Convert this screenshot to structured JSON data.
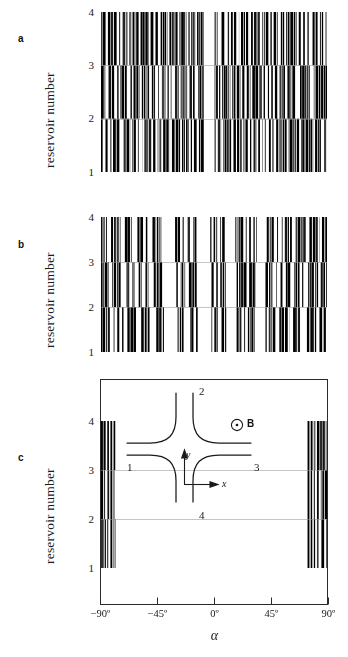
{
  "figure": {
    "background": "#ffffff",
    "ink": "#111111"
  },
  "panels": [
    {
      "letter": "a",
      "ylabel": "reservoir number",
      "yticks": [
        "1",
        "2",
        "3",
        "4"
      ]
    },
    {
      "letter": "b",
      "ylabel": "reservoir number",
      "yticks": [
        "1",
        "2",
        "3",
        "4"
      ]
    },
    {
      "letter": "c",
      "ylabel": "reservoir number",
      "yticks": [
        "1",
        "2",
        "3",
        "4"
      ],
      "xticks": [
        "−90º",
        "−45º",
        "0º",
        "45º",
        "90º"
      ],
      "xlabel": "α"
    }
  ],
  "inset": {
    "terminals": [
      "1",
      "2",
      "3",
      "4"
    ],
    "axis_x": "x",
    "axis_y": "y",
    "field_label": "B",
    "field_icon": "circle-dot-out-of-page-icon"
  },
  "chart_data": {
    "type": "heatmap",
    "title": "",
    "xlabel": "α",
    "ylabel": "reservoir number",
    "xlim": [
      -90,
      90
    ],
    "ylim": [
      1,
      4
    ],
    "xticks": [
      -90,
      -45,
      0,
      45,
      90
    ],
    "yticks": [
      1,
      2,
      3,
      4
    ],
    "xtick_labels": [
      "−90º",
      "−45º",
      "0º",
      "45º",
      "90º"
    ],
    "ytick_labels": [
      "1",
      "2",
      "3",
      "4"
    ],
    "grid": false,
    "legend": false,
    "panels": [
      {
        "label": "a",
        "coverage_note": "near-complete black coverage across the full alpha range with a narrow white gap just left of 0 degrees",
        "white_gaps": [
          [
            -8.0,
            0.5
          ]
        ],
        "series": [
          {
            "name": "reservoir-1",
            "band": [
              1,
              2
            ],
            "filled_intervals": [
              [
                -90,
                -84
              ],
              [
                -82.5,
                -74
              ],
              [
                -72,
                -66.5
              ],
              [
                -65,
                -57
              ],
              [
                -55.5,
                -50
              ],
              [
                -48.5,
                -42
              ],
              [
                -40.5,
                -35
              ],
              [
                -33.5,
                -27
              ],
              [
                -25.5,
                -20
              ],
              [
                -18.5,
                -13.5
              ],
              [
                -12,
                -8
              ],
              [
                0.5,
                6
              ],
              [
                7.5,
                14
              ],
              [
                15.5,
                22
              ],
              [
                23.5,
                30
              ],
              [
                31.5,
                39
              ],
              [
                40.5,
                48
              ],
              [
                49.5,
                58
              ],
              [
                59.5,
                68
              ],
              [
                69.5,
                79
              ],
              [
                80.5,
                90
              ]
            ]
          },
          {
            "name": "reservoir-2",
            "band": [
              2,
              3
            ],
            "filled_intervals": [
              [
                -90,
                -85.5
              ],
              [
                -84,
                -76
              ],
              [
                -74.5,
                -68
              ],
              [
                -66.5,
                -59
              ],
              [
                -57.5,
                -51
              ],
              [
                -49.5,
                -43
              ],
              [
                -41.5,
                -36
              ],
              [
                -34.5,
                -28
              ],
              [
                -26.5,
                -21
              ],
              [
                -19.5,
                -14
              ],
              [
                -12.5,
                -8
              ],
              [
                0.5,
                5
              ],
              [
                6.5,
                13
              ],
              [
                14.5,
                21
              ],
              [
                22.5,
                29
              ],
              [
                30.5,
                38
              ],
              [
                39.5,
                47
              ],
              [
                48.5,
                57
              ],
              [
                58.5,
                67
              ],
              [
                68.5,
                78
              ],
              [
                79.5,
                90
              ]
            ]
          },
          {
            "name": "reservoir-3",
            "band": [
              3,
              4
            ],
            "filled_intervals": [
              [
                -90,
                -86
              ],
              [
                -84.5,
                -77
              ],
              [
                -75.5,
                -69
              ],
              [
                -67.5,
                -60
              ],
              [
                -58.5,
                -52
              ],
              [
                -50.5,
                -44
              ],
              [
                -42.5,
                -37
              ],
              [
                -35.5,
                -29
              ],
              [
                -27.5,
                -22
              ],
              [
                -20.5,
                -15
              ],
              [
                -13.5,
                -8
              ],
              [
                0.5,
                4.5
              ],
              [
                6,
                12
              ],
              [
                13.5,
                20
              ],
              [
                21.5,
                28
              ],
              [
                29.5,
                37
              ],
              [
                38.5,
                46
              ],
              [
                47.5,
                56
              ],
              [
                57.5,
                66
              ],
              [
                67.5,
                77
              ],
              [
                78.5,
                90
              ]
            ]
          }
        ]
      },
      {
        "label": "b",
        "coverage_note": "sparser, blockier stripes with several wide white bands; reservoir 1-2 band is noticeably emptier than in panel a",
        "white_gaps": [
          [
            -38,
            -31
          ],
          [
            -12,
            -3
          ],
          [
            10,
            17
          ],
          [
            34,
            40
          ]
        ],
        "series": [
          {
            "name": "reservoir-1",
            "band": [
              1,
              2
            ],
            "filled_intervals": [
              [
                -90,
                -83
              ],
              [
                -80,
                -72
              ],
              [
                -69,
                -62
              ],
              [
                -58,
                -50
              ],
              [
                -46,
                -39
              ],
              [
                -29,
                -22
              ],
              [
                -19,
                -13
              ],
              [
                -2,
                4
              ],
              [
                6,
                10
              ],
              [
                18,
                25
              ],
              [
                27,
                33
              ],
              [
                41,
                49
              ],
              [
                52,
                60
              ],
              [
                63,
                71
              ],
              [
                74,
                82
              ],
              [
                84,
                90
              ]
            ]
          },
          {
            "name": "reservoir-2",
            "band": [
              2,
              3
            ],
            "filled_intervals": [
              [
                -90,
                -84
              ],
              [
                -81,
                -73
              ],
              [
                -70,
                -63
              ],
              [
                -60,
                -52
              ],
              [
                -48,
                -41
              ],
              [
                -30,
                -23
              ],
              [
                -20,
                -13
              ],
              [
                -2,
                3
              ],
              [
                5,
                10
              ],
              [
                18,
                26
              ],
              [
                28,
                33
              ],
              [
                41,
                50
              ],
              [
                53,
                61
              ],
              [
                64,
                72
              ],
              [
                75,
                83
              ],
              [
                85,
                90
              ]
            ]
          },
          {
            "name": "reservoir-3",
            "band": [
              3,
              4
            ],
            "filled_intervals": [
              [
                -90,
                -85
              ],
              [
                -82,
                -74
              ],
              [
                -71,
                -64
              ],
              [
                -61,
                -53
              ],
              [
                -49,
                -42
              ],
              [
                -31,
                -24
              ],
              [
                -21,
                -14
              ],
              [
                -3,
                3
              ],
              [
                5,
                9
              ],
              [
                17,
                26
              ],
              [
                28,
                34
              ],
              [
                42,
                51
              ],
              [
                54,
                62
              ],
              [
                65,
                73
              ],
              [
                76,
                84
              ],
              [
                86,
                90
              ]
            ]
          }
        ]
      },
      {
        "label": "c",
        "coverage_note": "stripes confined to narrow clusters at the two extreme angles only; the entire central range is white. Black extends only over reservoir numbers 1 to 4 band region above the y=1 line.",
        "white_gaps": [
          [
            -78,
            74
          ]
        ],
        "series": [
          {
            "name": "reservoir-1",
            "band": [
              1,
              2
            ],
            "filled_intervals": [
              [
                -90,
                -86
              ],
              [
                -85,
                -83.5
              ],
              [
                -82.5,
                -81
              ],
              [
                -80,
                -78.5
              ],
              [
                74.5,
                76
              ],
              [
                77,
                78.5
              ],
              [
                79.5,
                81
              ],
              [
                82,
                90
              ]
            ]
          },
          {
            "name": "reservoir-2",
            "band": [
              2,
              3
            ],
            "filled_intervals": [
              [
                -90,
                -86
              ],
              [
                -85,
                -83.5
              ],
              [
                -82.5,
                -81
              ],
              [
                -80,
                -78.5
              ],
              [
                74.5,
                76
              ],
              [
                77,
                78.5
              ],
              [
                79.5,
                81
              ],
              [
                82,
                90
              ]
            ]
          },
          {
            "name": "reservoir-3",
            "band": [
              3,
              4
            ],
            "filled_intervals": [
              [
                -90,
                -86
              ],
              [
                -85,
                -83.5
              ],
              [
                -82.5,
                -81
              ],
              [
                -80,
                -78.5
              ],
              [
                74.5,
                76
              ],
              [
                77,
                78.5
              ],
              [
                79.5,
                81
              ],
              [
                82,
                90
              ]
            ]
          }
        ]
      }
    ]
  }
}
